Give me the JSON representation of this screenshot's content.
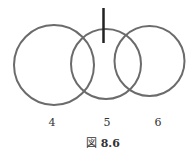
{
  "diagram": {
    "circles": [
      {
        "label": "4",
        "cx": 54,
        "cy": 65,
        "r": 40
      },
      {
        "label": "5",
        "cx": 106,
        "cy": 64,
        "r": 35
      },
      {
        "label": "6",
        "cx": 149.5,
        "cy": 61,
        "r": 35
      }
    ],
    "marker": {
      "x": 103.5,
      "y1": 8,
      "y2": 43
    },
    "stroke_color": "#6b6b6b",
    "marker_color": "#222222"
  },
  "labels": {
    "c4": "4",
    "c5": "5",
    "c6": "6"
  },
  "caption": {
    "prefix": "図",
    "number": "8.6"
  }
}
